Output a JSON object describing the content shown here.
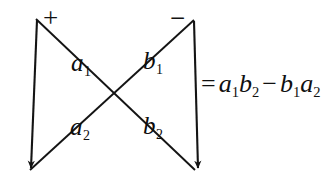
{
  "figure": {
    "background_color": "#ffffff",
    "stroke_color": "#141414"
  },
  "signs": {
    "plus": "+",
    "minus": "−"
  },
  "labels": {
    "a1": {
      "base": "a",
      "sub": "1"
    },
    "b1": {
      "base": "b",
      "sub": "1"
    },
    "a2": {
      "base": "a",
      "sub": "2"
    },
    "b2": {
      "base": "b",
      "sub": "2"
    }
  },
  "equation": {
    "equals": "=",
    "term1": {
      "first": {
        "base": "a",
        "sub": "1"
      },
      "second": {
        "base": "b",
        "sub": "2"
      }
    },
    "operator": "−",
    "term2": {
      "first": {
        "base": "b",
        "sub": "1"
      },
      "second": {
        "base": "a",
        "sub": "2"
      }
    }
  }
}
